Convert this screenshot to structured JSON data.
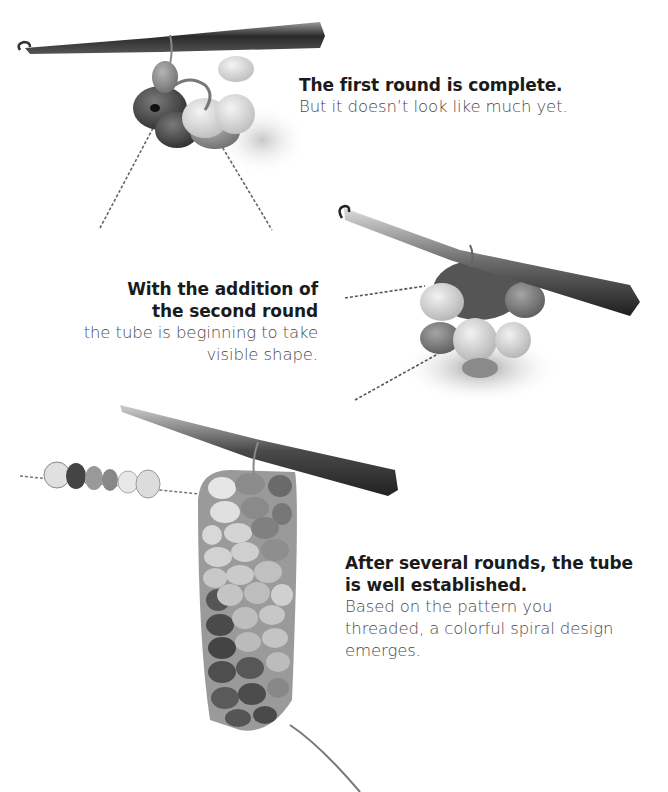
{
  "steps": [
    {
      "heading": "The first round is complete.",
      "body": "But it doesn’t look like much yet.",
      "illustration": "crochet-hook-first-round-beads"
    },
    {
      "heading_line1": "With the addition of",
      "heading_line2": "the second round",
      "body_line1": "the tube is beginning to take",
      "body_line2": "visible shape.",
      "illustration": "crochet-hook-second-round-beads"
    },
    {
      "heading_line1": "After several rounds, the tube",
      "heading_line2": "is well established.",
      "body_line1": "Based on the pattern you",
      "body_line2": "threaded, a colorful spiral design",
      "body_line3": "emerges.",
      "illustration": "crochet-hook-bead-tube-spiral"
    }
  ],
  "colors": {
    "heading_text": "#1b1b1b",
    "body_text": "#4a4a4a",
    "background": "#ffffff"
  }
}
